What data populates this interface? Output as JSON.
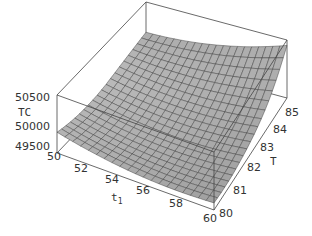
{
  "chart_data": {
    "type": "surface3d",
    "title": "",
    "xlabel": "t1",
    "ylabel": "T",
    "zlabel": "TC",
    "x_ticks": [
      "50",
      "52",
      "54",
      "56",
      "58",
      "60"
    ],
    "y_ticks": [
      "80",
      "81",
      "82",
      "83",
      "84",
      "85"
    ],
    "z_ticks": [
      "49500",
      "50000",
      "50500"
    ],
    "xlim": [
      50,
      60
    ],
    "ylim": [
      80,
      85
    ],
    "zlim": [
      49300,
      50700
    ],
    "grid": false,
    "legend": null,
    "mesh": "20x20",
    "surface_color": "#a8a8a8",
    "mesh_color": "#333333",
    "box_color": "#333333"
  },
  "labels": {
    "z_axis": "TC",
    "x_axis_main": "t",
    "x_axis_sub": "1",
    "y_axis": "T"
  }
}
